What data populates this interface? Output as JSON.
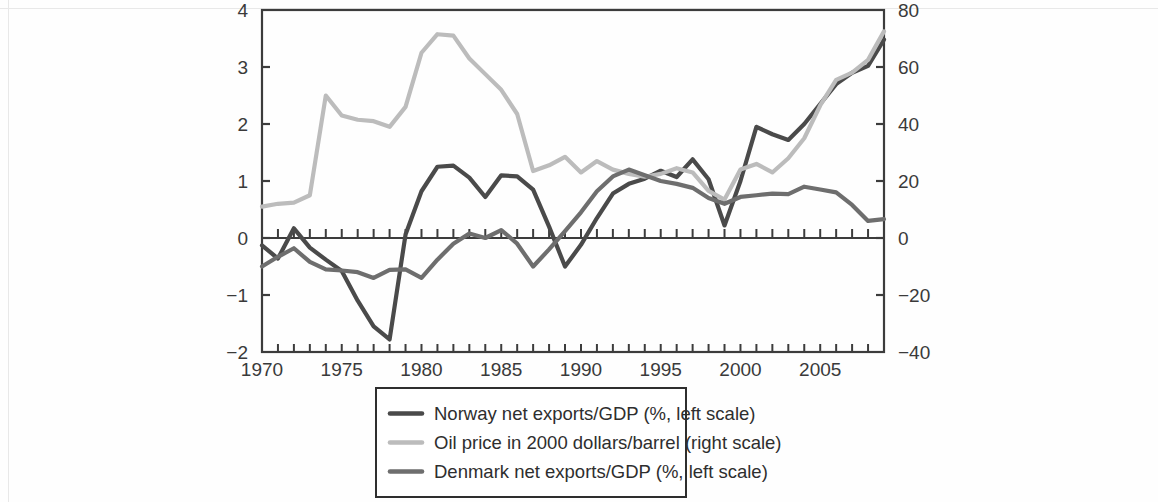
{
  "figure": {
    "background_color": "#fefefe",
    "plot_border_color": "#3c3c3c"
  },
  "chart_data": {
    "type": "line",
    "title": "",
    "subtitle": "",
    "xlabel": "",
    "ylabel": "",
    "y2label": "",
    "grid": false,
    "legend_position": "bottom",
    "x": [
      1970,
      1971,
      1972,
      1973,
      1974,
      1975,
      1976,
      1977,
      1978,
      1979,
      1980,
      1981,
      1982,
      1983,
      1984,
      1985,
      1986,
      1987,
      1988,
      1989,
      1990,
      1991,
      1992,
      1993,
      1994,
      1995,
      1996,
      1997,
      1998,
      1999,
      2000,
      2001,
      2002,
      2003,
      2004,
      2005,
      2006,
      2007,
      2008,
      2009
    ],
    "xlim": [
      1970,
      2009
    ],
    "xticks_major": [
      1970,
      1975,
      1980,
      1985,
      1990,
      1995,
      2000,
      2005
    ],
    "xtick_labels": [
      "1970",
      "1975",
      "1980",
      "1985",
      "1990",
      "1995",
      "2000",
      "2005"
    ],
    "xticks_minor_step": 1,
    "ylim": [
      -2,
      4
    ],
    "yticks": [
      -2,
      -1,
      0,
      1,
      2,
      3,
      4
    ],
    "ytick_labels": [
      "−2",
      "−1",
      "0",
      "1",
      "2",
      "3",
      "4"
    ],
    "y2lim": [
      -40,
      80
    ],
    "y2ticks": [
      -40,
      -20,
      0,
      20,
      40,
      60,
      80
    ],
    "y2tick_labels": [
      "−40",
      "−20",
      "0",
      "20",
      "40",
      "60",
      "80"
    ],
    "series": [
      {
        "name": "Norway net exports/GDP (%, left scale)",
        "key": "norway",
        "axis": "left",
        "color": "#4a4a4a",
        "linewidth": 4.2,
        "values": [
          -0.13,
          -0.36,
          0.17,
          -0.17,
          -0.38,
          -0.58,
          -1.1,
          -1.55,
          -1.78,
          0.06,
          0.82,
          1.25,
          1.27,
          1.06,
          0.72,
          1.1,
          1.08,
          0.85,
          0.2,
          -0.5,
          -0.12,
          0.35,
          0.78,
          0.95,
          1.04,
          1.18,
          1.07,
          1.38,
          1.03,
          0.22,
          1.0,
          1.95,
          1.82,
          1.72,
          2.0,
          2.35,
          2.7,
          2.9,
          3.02,
          3.48
        ]
      },
      {
        "name": "Oil price in 2000 dollars/barrel (right scale)",
        "key": "oil",
        "axis": "right",
        "color": "#bcbcbc",
        "linewidth": 4.2,
        "values": [
          11.0,
          12.0,
          12.4,
          15.0,
          50.0,
          43.0,
          41.5,
          41.0,
          39.0,
          46.0,
          65.0,
          71.5,
          71.0,
          63.0,
          57.5,
          52.0,
          43.5,
          23.5,
          25.5,
          28.5,
          23.0,
          27.0,
          24.0,
          22.5,
          21.5,
          22.5,
          24.5,
          23.0,
          16.5,
          13.5,
          24.0,
          26.0,
          23.0,
          28.0,
          35.0,
          46.5,
          55.5,
          58.0,
          62.5,
          72.5
        ]
      },
      {
        "name": "Denmark net exports/GDP (%, left scale)",
        "key": "denmark",
        "axis": "left",
        "color": "#6e6e6e",
        "linewidth": 4.2,
        "values": [
          -0.5,
          -0.33,
          -0.18,
          -0.42,
          -0.55,
          -0.57,
          -0.6,
          -0.7,
          -0.56,
          -0.55,
          -0.7,
          -0.38,
          -0.1,
          0.08,
          0.0,
          0.14,
          -0.1,
          -0.5,
          -0.2,
          0.12,
          0.45,
          0.82,
          1.08,
          1.2,
          1.1,
          1.0,
          0.95,
          0.88,
          0.7,
          0.6,
          0.72,
          0.75,
          0.78,
          0.77,
          0.9,
          0.85,
          0.8,
          0.58,
          0.3,
          0.33
        ]
      }
    ]
  },
  "legend": {
    "entries": [
      {
        "label": "Norway net exports/GDP (%, left scale)",
        "color": "#4a4a4a"
      },
      {
        "label": "Oil price in 2000 dollars/barrel (right scale)",
        "color": "#bcbcbc"
      },
      {
        "label": "Denmark net exports/GDP (%, left scale)",
        "color": "#6e6e6e"
      }
    ],
    "border_color": "#2e2e2e"
  }
}
